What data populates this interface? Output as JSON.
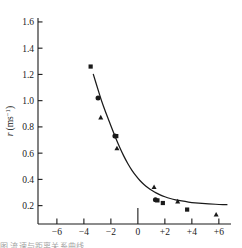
{
  "figure": {
    "background_color": "#ffffff",
    "ink_color": "#1a1a1a",
    "caption_fragment": "图  流速与距离关系曲线"
  },
  "chart_data": {
    "type": "scatter",
    "title": "",
    "subtitle": "",
    "xlabel": "",
    "ylabel": "r (ms⁻¹)",
    "ylabel_symbol": "r",
    "ylabel_unit": "(ms",
    "ylabel_exponent": "−1",
    "ylabel_unit_close": ")",
    "xlim": [
      -7.4,
      6.9
    ],
    "ylim": [
      0.06,
      1.63
    ],
    "grid": false,
    "legend": "none",
    "xticks": [
      -6,
      -4,
      -2,
      0,
      2,
      4,
      6
    ],
    "xtick_labels": [
      "−6",
      "−4",
      "−2",
      "0",
      "+2",
      "+4",
      "+6"
    ],
    "yticks": [
      0.2,
      0.4,
      0.6,
      0.8,
      1.0,
      1.2,
      1.4,
      1.6
    ],
    "ytick_labels": [
      "0.2",
      "0.4",
      "0.6",
      "0.8",
      "1.0",
      "1.2",
      "1.4",
      "1.6"
    ],
    "axis_style": {
      "y_axis_at_x": -7.4,
      "x_axis_at_y": 0.06,
      "tick_direction": "inward",
      "zero_tick_extended": true
    },
    "series": [
      {
        "name": "square-markers",
        "marker": "square",
        "points": [
          {
            "x": -3.5,
            "y": 1.26
          },
          {
            "x": -1.6,
            "y": 0.73
          },
          {
            "x": 1.45,
            "y": 0.24
          },
          {
            "x": 1.85,
            "y": 0.22
          },
          {
            "x": 3.65,
            "y": 0.17
          }
        ]
      },
      {
        "name": "circle-markers",
        "marker": "circle",
        "points": [
          {
            "x": -2.95,
            "y": 1.02
          },
          {
            "x": -1.7,
            "y": 0.73
          },
          {
            "x": 1.3,
            "y": 0.245
          }
        ]
      },
      {
        "name": "triangle-markers",
        "marker": "triangle",
        "points": [
          {
            "x": -2.75,
            "y": 0.87
          },
          {
            "x": -1.55,
            "y": 0.635
          },
          {
            "x": 1.2,
            "y": 0.34
          },
          {
            "x": 2.95,
            "y": 0.23
          },
          {
            "x": 5.8,
            "y": 0.13
          }
        ]
      }
    ],
    "fit_curve": {
      "name": "fitted-decay-curve",
      "description": "smooth monotonically decreasing curve",
      "points": [
        {
          "x": -3.3,
          "y": 1.2
        },
        {
          "x": -3.0,
          "y": 1.1
        },
        {
          "x": -2.7,
          "y": 1.0
        },
        {
          "x": -2.4,
          "y": 0.915
        },
        {
          "x": -2.1,
          "y": 0.835
        },
        {
          "x": -1.8,
          "y": 0.755
        },
        {
          "x": -1.5,
          "y": 0.68
        },
        {
          "x": -1.2,
          "y": 0.61
        },
        {
          "x": -0.9,
          "y": 0.548
        },
        {
          "x": -0.6,
          "y": 0.494
        },
        {
          "x": -0.3,
          "y": 0.448
        },
        {
          "x": 0.0,
          "y": 0.408
        },
        {
          "x": 0.3,
          "y": 0.375
        },
        {
          "x": 0.6,
          "y": 0.348
        },
        {
          "x": 0.9,
          "y": 0.325
        },
        {
          "x": 1.2,
          "y": 0.305
        },
        {
          "x": 1.5,
          "y": 0.289
        },
        {
          "x": 1.8,
          "y": 0.275
        },
        {
          "x": 2.2,
          "y": 0.26
        },
        {
          "x": 2.6,
          "y": 0.249
        },
        {
          "x": 3.0,
          "y": 0.24
        },
        {
          "x": 3.5,
          "y": 0.231
        },
        {
          "x": 4.0,
          "y": 0.224
        },
        {
          "x": 4.5,
          "y": 0.219
        },
        {
          "x": 5.0,
          "y": 0.215
        },
        {
          "x": 5.5,
          "y": 0.212
        },
        {
          "x": 6.0,
          "y": 0.209
        },
        {
          "x": 6.6,
          "y": 0.207
        }
      ]
    }
  }
}
